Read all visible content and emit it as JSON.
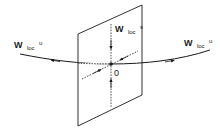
{
  "diagram": {
    "title": "",
    "colors": {
      "stroke": "#1a1a1a",
      "dashed": "#2a2a2a",
      "background": "#ffffff"
    },
    "plane": {
      "corners": [
        [
          78,
          34
        ],
        [
          142,
          5
        ],
        [
          142,
          95
        ],
        [
          78,
          126
        ]
      ]
    },
    "origin": {
      "label": "0",
      "x": 111,
      "y": 64
    },
    "labels": {
      "unstable_left": {
        "main": "W",
        "sub": "loc",
        "sup": "u"
      },
      "unstable_right": {
        "main": "W",
        "sub": "loc",
        "sup": "u"
      },
      "stable": {
        "main": "W",
        "sub": "loc",
        "sup": "s"
      }
    },
    "manifolds": {
      "unstable": {
        "name": "local unstable manifold",
        "direction": "outward from origin"
      },
      "stable": {
        "name": "local stable manifold",
        "direction": "inward toward origin"
      }
    }
  }
}
